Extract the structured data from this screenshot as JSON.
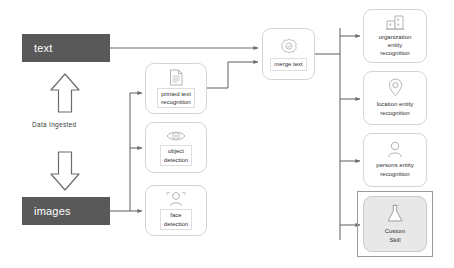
{
  "diagram": {
    "colors": {
      "source_block_fill": "#595959",
      "source_block_text": "#ffffff",
      "card_border": "#d4d4d4",
      "card_fill": "#ffffff",
      "custom_skill_fill": "#e8e8e8",
      "custom_skill_frame": "#9b9b9b",
      "connector": "#6b6b6b",
      "icon_stroke": "#b3b3b3"
    },
    "sources": [
      {
        "id": "text",
        "label": "text"
      },
      {
        "id": "images",
        "label": "images"
      }
    ],
    "ingest_label": "Data Ingested",
    "ingest_arrows": [
      {
        "id": "ingest-arrow-up",
        "direction": "up"
      },
      {
        "id": "ingest-arrow-down",
        "direction": "down"
      }
    ],
    "skills": [
      {
        "id": "printed-text-recognition",
        "label": "printed text\nrecognition",
        "icon": "document-icon"
      },
      {
        "id": "object-detection",
        "label": "object\ndetection",
        "icon": "eye-icon"
      },
      {
        "id": "face-detection",
        "label": "face\ndetection",
        "icon": "face-icon"
      }
    ],
    "merge": {
      "id": "merge-text",
      "label": "merge text",
      "icon": "merge-gear-icon"
    },
    "enrichments": [
      {
        "id": "organization-entity-recognition",
        "label": "organization\nentity\nrecognition",
        "icon": "building-icon"
      },
      {
        "id": "location-entity-recognition",
        "label": "location entity\nrecognition",
        "icon": "map-pin-icon"
      },
      {
        "id": "persons-entity-recognition",
        "label": "persons entity\nrecognition",
        "icon": "person-icon"
      }
    ],
    "custom_skill": {
      "id": "custom-skill",
      "label": "Custom\nSkill",
      "icon": "flask-icon"
    }
  }
}
